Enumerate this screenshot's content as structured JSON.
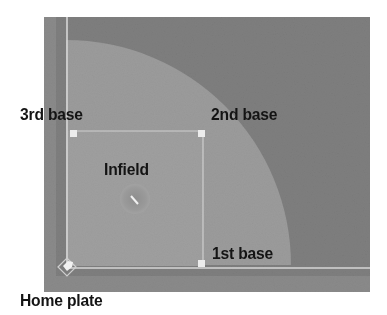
{
  "diagram": {
    "colors": {
      "outfield": "#7e7e7e",
      "infield_arc": "#9c9c9c",
      "infield_square": "#a0a0a0",
      "lines": "#d8d8d8",
      "base": "#e8e8e8",
      "label": "#141414",
      "background": "#ffffff"
    },
    "labels": {
      "third_base": "3rd base",
      "second_base": "2nd base",
      "infield": "Infield",
      "first_base": "1st base",
      "home_plate": "Home plate"
    }
  }
}
